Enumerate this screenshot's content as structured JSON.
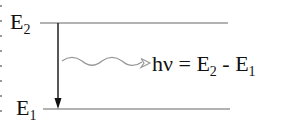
{
  "diagram": {
    "type": "energy-level-diagram",
    "levels": [
      {
        "id": "upper",
        "symbol": "E",
        "subscript": "2",
        "y": 23,
        "x_start": 40,
        "x_end": 228
      },
      {
        "id": "lower",
        "symbol": "E",
        "subscript": "1",
        "y": 109,
        "x_start": 43,
        "x_end": 230
      }
    ],
    "transition": {
      "from": "E2",
      "to": "E1",
      "x": 58,
      "direction": "down"
    },
    "photon": {
      "style": "wavy",
      "color": "#999999",
      "x_start": 62,
      "x_end": 150,
      "y": 63
    },
    "equation": {
      "h": "h",
      "nu": "ν",
      "equals": "=",
      "e2_symbol": "E",
      "e2_sub": "2",
      "minus": "-",
      "e1_symbol": "E",
      "e1_sub": "1"
    },
    "colors": {
      "line": "#999999",
      "arrow": "#111111",
      "text": "#111111",
      "background": "#ffffff"
    }
  }
}
